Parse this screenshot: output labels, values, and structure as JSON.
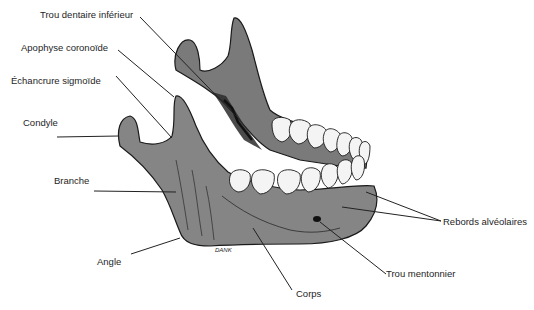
{
  "figure": {
    "signature": "DANK",
    "colors": {
      "bone": "#858585",
      "bone_shadow": "#6a6a6a",
      "outline": "#1a1a1a",
      "teeth": "#f4f4f4",
      "leader": "#222222",
      "text": "#1e1e1e"
    }
  },
  "labels": {
    "trou_dentaire": "Trou dentaire inférieur",
    "apophyse": "Apophyse coronoïde",
    "echancrure": "Échancrure sigmoïde",
    "condyle": "Condyle",
    "branche": "Branche",
    "angle": "Angle",
    "corps": "Corps",
    "trou_mentonnier": "Trou mentonnier",
    "rebords": "Rebords alvéolaires"
  }
}
